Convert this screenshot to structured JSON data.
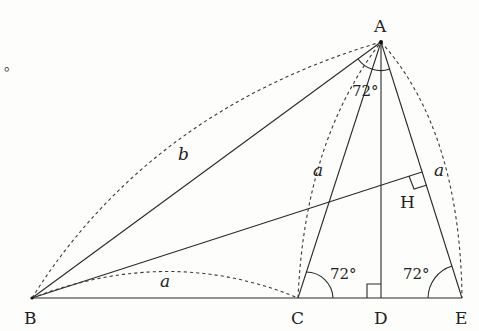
{
  "diagram": {
    "type": "geometry-figure",
    "points": {
      "A": {
        "label": "A",
        "x": 381,
        "y": 42
      },
      "B": {
        "label": "B",
        "x": 32,
        "y": 298
      },
      "C": {
        "label": "C",
        "x": 298,
        "y": 298
      },
      "D": {
        "label": "D",
        "x": 381,
        "y": 298
      },
      "E": {
        "label": "E",
        "x": 462,
        "y": 298
      },
      "H": {
        "label": "H",
        "x": 422,
        "y": 172
      }
    },
    "segment_labels": {
      "AB": "b",
      "BC": "a",
      "AC": "a",
      "AE": "a"
    },
    "angle_labels": {
      "A": "72°",
      "C": "72°",
      "E": "72°"
    },
    "right_angles": [
      "D",
      "H"
    ],
    "fragment_text": "。"
  }
}
